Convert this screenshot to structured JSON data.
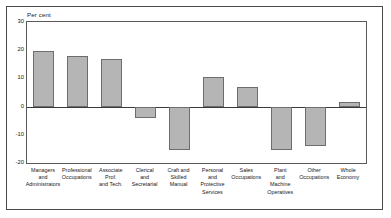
{
  "chart_data": {
    "type": "bar",
    "title": "",
    "subtitle": "",
    "xlabel": "",
    "ylabel": "Per cent",
    "ylim": [
      -20,
      30
    ],
    "yticks": [
      30,
      20,
      10,
      0,
      -10,
      -20
    ],
    "ytick_labels": [
      "30",
      "20",
      "10",
      "0",
      "-10",
      "-20"
    ],
    "grid": false,
    "legend": "none",
    "zero_line": true,
    "bar_color": "#b5b5b5",
    "bar_border_color": "#6d6d6d",
    "categories": [
      "Managers\nand\nAdministrators",
      "Professional\nOccupations",
      "Associate\nProf.\nand Tech.",
      "Clerical\nand\nSecretarial",
      "Craft and\nSkilled\nManual",
      "Personal\nand\nProtective\nServices",
      "Sales\nOccupations",
      "Plant\nand\nMachine\nOperatives",
      "Other\nOccupations",
      "Whole\nEconomy"
    ],
    "values": [
      19.7,
      18.0,
      16.8,
      -4.2,
      -15.3,
      10.5,
      6.8,
      -15.5,
      -14.0,
      1.5
    ]
  },
  "colors": {
    "frame": "#4a4a4a",
    "plot_frame": "#5a5a5a",
    "axis": "#3a3a3a",
    "text": "#1a1a1a",
    "background": "#ffffff"
  }
}
